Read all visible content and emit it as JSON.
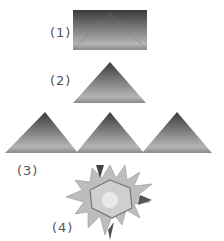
{
  "steps": [
    {
      "label": "(1)",
      "shape": "folded rectangle"
    },
    {
      "label": "(2)",
      "shape": "triangle"
    },
    {
      "label": "(3)",
      "shape": "three triangles in a row"
    },
    {
      "label": "(4)",
      "shape": "assembled star"
    }
  ],
  "colors": {
    "dark": "#3a3a3a",
    "mid": "#8a8a8a",
    "light": "#c8c8c8"
  }
}
